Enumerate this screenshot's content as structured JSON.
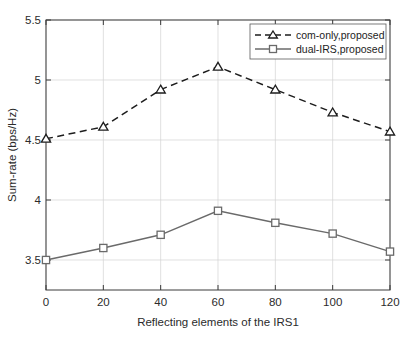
{
  "chart_data": {
    "type": "line",
    "title": "",
    "xlabel": "Reflecting elements of the IRS1",
    "ylabel": "Sum-rate (bps/Hz)",
    "x": [
      0,
      20,
      40,
      60,
      80,
      100,
      120
    ],
    "xlim": [
      0,
      120
    ],
    "ylim": [
      3.25,
      5.5
    ],
    "xticks": [
      "0",
      "20",
      "40",
      "60",
      "80",
      "100",
      "120"
    ],
    "yticks": [
      "3.5",
      "4",
      "4.5",
      "5",
      "5.5"
    ],
    "ytick_values": [
      3.5,
      4,
      4.5,
      5,
      5.5
    ],
    "grid": true,
    "legend_position": "top-right",
    "series": [
      {
        "name": "com-only,proposed",
        "values": [
          4.51,
          4.61,
          4.92,
          5.11,
          4.92,
          4.73,
          4.57
        ],
        "line_style": "dashed",
        "marker": "triangle",
        "color": "#1d1d1d"
      },
      {
        "name": "dual-IRS,proposed",
        "values": [
          3.5,
          3.6,
          3.71,
          3.91,
          3.81,
          3.72,
          3.57
        ],
        "line_style": "solid",
        "marker": "square",
        "color": "#6a6a6a"
      }
    ]
  },
  "legend": {
    "entries": [
      {
        "label": "com-only,proposed"
      },
      {
        "label": "dual-IRS,proposed"
      }
    ]
  }
}
